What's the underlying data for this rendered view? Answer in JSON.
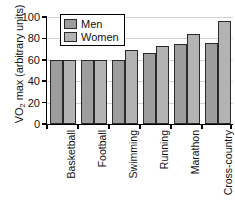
{
  "chart_data": {
    "type": "bar",
    "title": "",
    "xlabel": "",
    "ylabel": "VO2 max (arbitrary units)",
    "ylabel_parts": {
      "pre": "VO",
      "sub": "2",
      "post": " max (arbitrary units)"
    },
    "categories": [
      "Basketball",
      "Football",
      "Swimming",
      "Running",
      "Marathon",
      "Cross-country skiing"
    ],
    "category_lines": [
      [
        "Basketball"
      ],
      [
        "Football"
      ],
      [
        "Swimming"
      ],
      [
        "Running"
      ],
      [
        "Marathon"
      ],
      [
        "Cross-country",
        "skiing"
      ]
    ],
    "series": [
      {
        "name": "Men",
        "color": "#9d9d9d",
        "values": [
          60,
          60,
          60,
          66,
          75,
          76
        ]
      },
      {
        "name": "Women",
        "color": "#b3b3b3",
        "values": [
          60,
          60,
          69,
          73,
          84,
          96
        ]
      }
    ],
    "ylim": [
      0,
      100
    ],
    "yticks": [
      0,
      20,
      40,
      60,
      80,
      100
    ],
    "ytick_labels": [
      "0",
      "20",
      "40",
      "60",
      "80",
      "100"
    ],
    "grid": true,
    "grid_axis": "y",
    "legend_position": "top-left-inside",
    "bar_edge_color": "#2a2a2a",
    "axis_color": "#000000",
    "grid_color": "#d2d2d2",
    "background": "#ffffff"
  },
  "legend": {
    "entries": [
      {
        "label": "Men"
      },
      {
        "label": "Women"
      }
    ]
  }
}
